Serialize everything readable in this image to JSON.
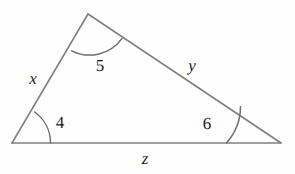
{
  "figure": {
    "type": "geometry-diagram",
    "shape": "triangle",
    "background_color": "#fefefe",
    "stroke_color": "#808080",
    "arc_color": "#6e6e6e",
    "text_color": "#1b1b1b",
    "canvas": {
      "width": 295,
      "height": 174
    },
    "vertices": [
      {
        "name": "vertex-left",
        "x": 12,
        "y": 143
      },
      {
        "name": "vertex-top",
        "x": 88,
        "y": 14
      },
      {
        "name": "vertex-right",
        "x": 281,
        "y": 143
      }
    ],
    "sides": [
      {
        "name": "side-x",
        "label": "x",
        "from": "vertex-left",
        "to": "vertex-top",
        "label_x": 33,
        "label_y": 78
      },
      {
        "name": "side-y",
        "label": "y",
        "from": "vertex-top",
        "to": "vertex-right",
        "label_x": 192,
        "label_y": 65
      },
      {
        "name": "side-z",
        "label": "z",
        "from": "vertex-left",
        "to": "vertex-right",
        "label_x": 145,
        "label_y": 158
      }
    ],
    "angles": [
      {
        "name": "angle-4",
        "label": "4",
        "at": "vertex-left",
        "label_x": 60,
        "label_y": 122
      },
      {
        "name": "angle-5",
        "label": "5",
        "at": "vertex-top",
        "label_x": 100,
        "label_y": 65
      },
      {
        "name": "angle-6",
        "label": "6",
        "at": "vertex-right",
        "label_x": 207,
        "label_y": 123
      }
    ]
  },
  "chart_data": {
    "type": "diagram",
    "title": "",
    "labels": [
      "x",
      "y",
      "z",
      "4",
      "5",
      "6"
    ]
  }
}
